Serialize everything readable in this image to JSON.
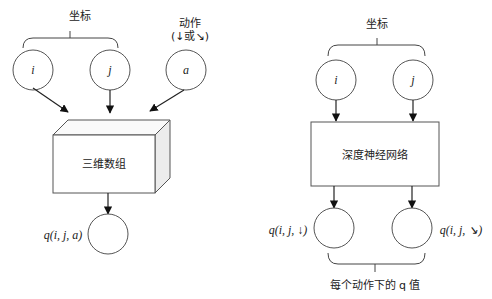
{
  "left": {
    "coords_label": "坐标",
    "action_label_line1": "动作",
    "action_label_line2": "(↓或↘)",
    "nodes": [
      "i",
      "j",
      "a"
    ],
    "box_label": "三维数组",
    "output_label": "q(i, j, a)"
  },
  "right": {
    "coords_label": "坐标",
    "nodes": [
      "i",
      "j"
    ],
    "box_label": "深度神经网络",
    "output_labels": [
      "q(i, j, ↓)",
      "q(i, j, ↘)"
    ],
    "bottom_label": "每个动作下的 q 值"
  },
  "colors": {
    "stroke": "#333333",
    "text": "#222222",
    "box_side": "#e8e8e8"
  }
}
